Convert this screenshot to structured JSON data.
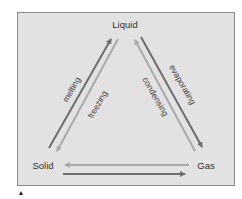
{
  "diagram": {
    "states": {
      "liquid": "Liquid",
      "solid": "Solid",
      "gas": "Gas"
    },
    "processes": {
      "melting": "melting",
      "freezing": "freezing",
      "evaporating": "evaporating",
      "condensing": "condensing"
    },
    "edges": [
      {
        "from": "Solid",
        "to": "Liquid",
        "label": "melting",
        "shade": "dark"
      },
      {
        "from": "Liquid",
        "to": "Solid",
        "label": "freezing",
        "shade": "light"
      },
      {
        "from": "Liquid",
        "to": "Gas",
        "label": "evaporating",
        "shade": "dark"
      },
      {
        "from": "Gas",
        "to": "Liquid",
        "label": "condensing",
        "shade": "light"
      },
      {
        "from": "Gas",
        "to": "Solid",
        "label": "",
        "shade": "light"
      },
      {
        "from": "Solid",
        "to": "Gas",
        "label": "",
        "shade": "dark"
      }
    ],
    "colors": {
      "background": "#e2e2e2",
      "border": "#8a8a8a",
      "arrow_dark": "#6e6e6e",
      "arrow_light": "#a9a9a9",
      "text": "#333333"
    }
  }
}
